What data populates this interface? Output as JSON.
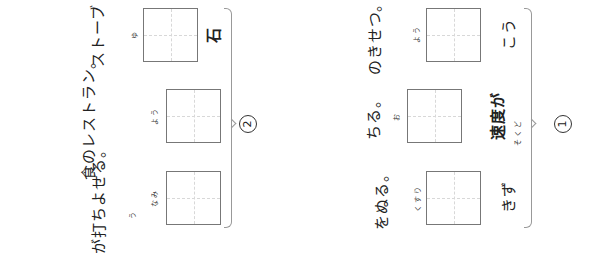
{
  "sections": [
    {
      "number": "1",
      "items": [
        {
          "before": "こう",
          "ruby": "よう",
          "after": "のきせつ。"
        },
        {
          "before": "速度が",
          "before_ruby": "そくど",
          "ruby": "お",
          "after": "ちる。"
        },
        {
          "before": "きず",
          "ruby": "くすり",
          "after": "をぬる。"
        }
      ]
    },
    {
      "number": "2",
      "items": [
        {
          "before": "石",
          "ruby": "ゆ",
          "after": "ストーブ"
        },
        {
          "before": "",
          "ruby": "よう",
          "after": "食のレストラン。"
        },
        {
          "before": "",
          "ruby": "なみ",
          "after": "が打ちよせる。",
          "after_ruby": "う"
        }
      ]
    }
  ]
}
